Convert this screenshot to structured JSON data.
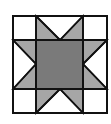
{
  "diagram": {
    "type": "quilt-block",
    "name": "star quilt block",
    "grid": "4x4 with center square spanning 2x2",
    "colors": {
      "background": "#ffffff",
      "light_gray": "#a6a6a6",
      "dark_gray": "#7a7a7a",
      "stroke": "#111111"
    }
  }
}
